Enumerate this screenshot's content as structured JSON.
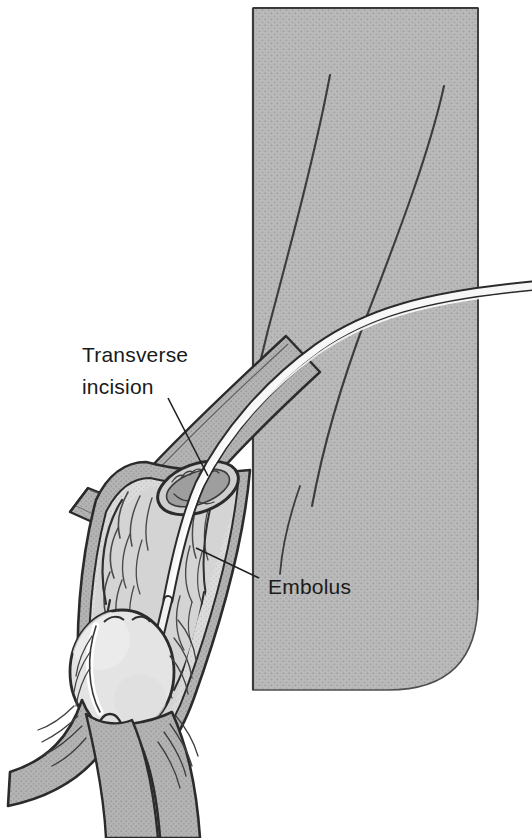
{
  "figure": {
    "background_color": "#ffffff",
    "width": 532,
    "height": 838
  },
  "panel": {
    "name": "anatomical-tissue-panel",
    "fill_color": "#b8b8b8",
    "border_color": "#4a4a4a",
    "stipple_color": "#9a9a9a",
    "x": 253,
    "y": 8,
    "width": 225,
    "height": 682,
    "corner_radius": 40
  },
  "labels": [
    {
      "id": "transverse-incision",
      "line1": "Transverse",
      "line2": "incision",
      "x": 82,
      "y1": 360,
      "y2": 392,
      "leader": {
        "from_x": 168,
        "from_y": 398,
        "to_x": 206,
        "to_y": 474
      }
    },
    {
      "id": "embolus",
      "line1": "Embolus",
      "line2": "",
      "x": 268,
      "y1": 592,
      "y2": 0,
      "leader": {
        "from_x": 258,
        "from_y": 578,
        "to_x": 196,
        "to_y": 548
      }
    }
  ],
  "vessel": {
    "wall_fill": "#b0b0b0",
    "lumen_fill": "#d8d8d8",
    "outline_color": "#2b2b2b",
    "hatch_color": "#555555"
  },
  "catheter": {
    "name": "embolectomy-catheter",
    "fill_color": "#f5f5f5",
    "outline_color": "#2b2b2b",
    "width": 9
  },
  "embolus_body": {
    "name": "embolus-mass",
    "fill_color": "#e2e2e2",
    "outline_color": "#2b2b2b",
    "cx": 122,
    "cy": 672,
    "rx": 52,
    "ry": 62
  },
  "panel_lines": [
    {
      "id": "tissue-line-left"
    },
    {
      "id": "tissue-line-right"
    }
  ]
}
